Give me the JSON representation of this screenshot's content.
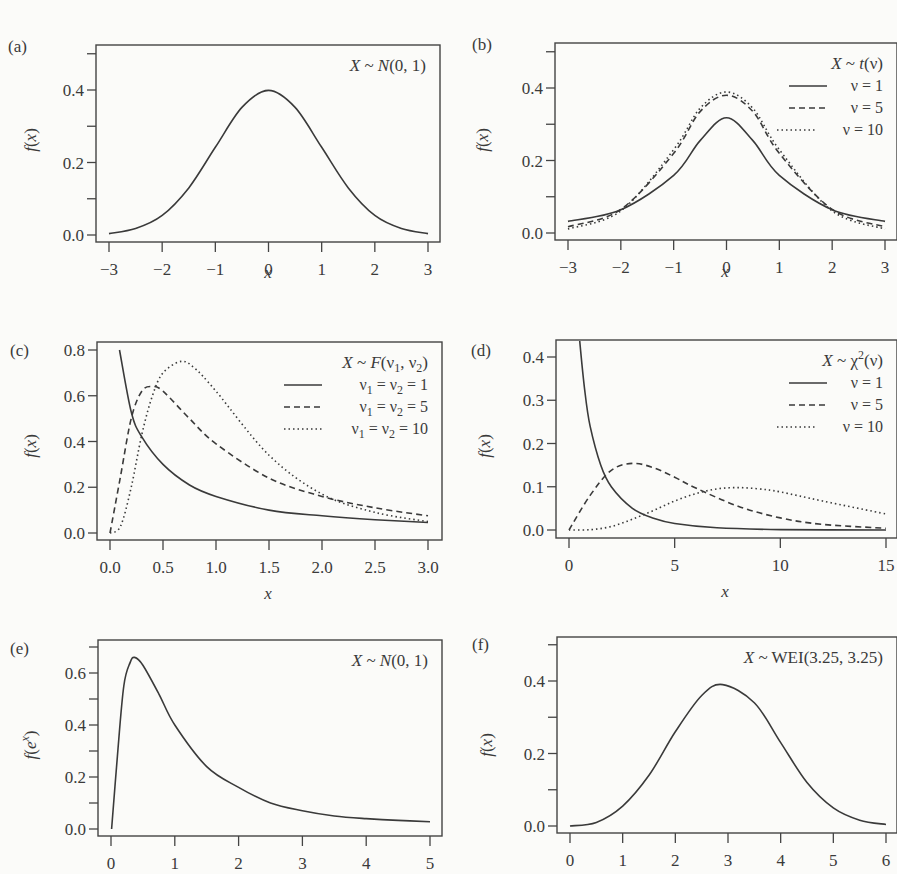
{
  "figure": {
    "panels": [
      {
        "id": "a",
        "label": "(a)",
        "title": "X ~ N(0, 1)",
        "ylabel": "f(x)",
        "xlabel": "x"
      },
      {
        "id": "b",
        "label": "(b)",
        "title": "X ~ t(ν)",
        "ylabel": "f(x)",
        "xlabel": "x",
        "legend": [
          "ν = 1",
          "ν = 5",
          "ν = 10"
        ]
      },
      {
        "id": "c",
        "label": "(c)",
        "title": "X ~ F(ν1, ν2)",
        "ylabel": "f(x)",
        "xlabel": "x",
        "legend": [
          "ν1 = ν2 = 1",
          "ν1 = ν2 = 5",
          "ν1 = ν2 = 10"
        ]
      },
      {
        "id": "d",
        "label": "(d)",
        "title": "X ~ χ2(ν)",
        "ylabel": "f(x)",
        "xlabel": "x",
        "legend": [
          "ν = 1",
          "ν = 5",
          "ν = 10"
        ]
      },
      {
        "id": "e",
        "label": "(e)",
        "title": "X ~ N(0, 1)",
        "ylabel": "f(e^x)",
        "xlabel": ""
      },
      {
        "id": "f",
        "label": "(f)",
        "title": "X ~ WEI(3.25, 3.25)",
        "ylabel": "f(x)",
        "xlabel": ""
      }
    ]
  },
  "chart_data": [
    {
      "panel": "a",
      "type": "line",
      "title": "X ~ N(0, 1)",
      "xlabel": "x",
      "ylabel": "f(x)",
      "xlim": [
        -3,
        3
      ],
      "ylim": [
        0,
        0.5
      ],
      "xticks": [
        "-3",
        "-2",
        "-1",
        "0",
        "1",
        "2",
        "3"
      ],
      "yticks": [
        "0.0",
        "0.2",
        "0.4"
      ],
      "series": [
        {
          "name": "N(0,1)",
          "style": "solid",
          "x": [
            -3,
            -2.5,
            -2,
            -1.5,
            -1,
            -0.5,
            0,
            0.5,
            1,
            1.5,
            2,
            2.5,
            3
          ],
          "y": [
            0.004,
            0.018,
            0.054,
            0.13,
            0.242,
            0.352,
            0.399,
            0.352,
            0.242,
            0.13,
            0.054,
            0.018,
            0.004
          ]
        }
      ],
      "grid": false
    },
    {
      "panel": "b",
      "type": "line",
      "title": "X ~ t(ν)",
      "xlabel": "x",
      "ylabel": "f(x)",
      "xlim": [
        -3,
        3
      ],
      "ylim": [
        0,
        0.5
      ],
      "xticks": [
        "-3",
        "-2",
        "-1",
        "0",
        "1",
        "2",
        "3"
      ],
      "yticks": [
        "0.0",
        "0.2",
        "0.4"
      ],
      "legend_position": "top-right",
      "series": [
        {
          "name": "ν = 1",
          "style": "solid",
          "x": [
            -3,
            -2,
            -1,
            -0.5,
            0,
            0.5,
            1,
            2,
            3
          ],
          "y": [
            0.032,
            0.064,
            0.159,
            0.255,
            0.318,
            0.255,
            0.159,
            0.064,
            0.032
          ]
        },
        {
          "name": "ν = 5",
          "style": "dashed",
          "x": [
            -3,
            -2,
            -1,
            -0.5,
            0,
            0.5,
            1,
            2,
            3
          ],
          "y": [
            0.017,
            0.065,
            0.22,
            0.335,
            0.38,
            0.335,
            0.22,
            0.065,
            0.017
          ]
        },
        {
          "name": "ν = 10",
          "style": "dotted",
          "x": [
            -3,
            -2,
            -1,
            -0.5,
            0,
            0.5,
            1,
            2,
            3
          ],
          "y": [
            0.011,
            0.061,
            0.23,
            0.344,
            0.389,
            0.344,
            0.23,
            0.061,
            0.011
          ]
        }
      ],
      "grid": false
    },
    {
      "panel": "c",
      "type": "line",
      "title": "X ~ F(ν1, ν2)",
      "xlabel": "x",
      "ylabel": "f(x)",
      "xlim": [
        0,
        3
      ],
      "ylim": [
        0,
        0.8
      ],
      "xticks": [
        "0.0",
        "0.5",
        "1.0",
        "1.5",
        "2.0",
        "2.5",
        "3.0"
      ],
      "yticks": [
        "0.0",
        "0.2",
        "0.4",
        "0.6",
        "0.8"
      ],
      "legend_position": "top-right",
      "series": [
        {
          "name": "ν1 = ν2 = 1",
          "style": "solid",
          "x": [
            0.09,
            0.2,
            0.3,
            0.5,
            0.75,
            1.0,
            1.5,
            2.0,
            2.5,
            3.0
          ],
          "y": [
            0.8,
            0.53,
            0.42,
            0.3,
            0.21,
            0.16,
            0.1,
            0.075,
            0.058,
            0.046
          ]
        },
        {
          "name": "ν1 = ν2 = 5",
          "style": "dashed",
          "x": [
            0,
            0.1,
            0.2,
            0.3,
            0.4,
            0.5,
            0.75,
            1.0,
            1.5,
            2.0,
            2.5,
            3.0
          ],
          "y": [
            0,
            0.25,
            0.5,
            0.62,
            0.64,
            0.62,
            0.5,
            0.39,
            0.24,
            0.16,
            0.11,
            0.075
          ]
        },
        {
          "name": "ν1 = ν2 = 10",
          "style": "dotted",
          "x": [
            0,
            0.1,
            0.2,
            0.3,
            0.4,
            0.5,
            0.67,
            0.8,
            1.0,
            1.5,
            2.0,
            2.5,
            3.0
          ],
          "y": [
            0,
            0.03,
            0.2,
            0.43,
            0.6,
            0.7,
            0.75,
            0.72,
            0.62,
            0.34,
            0.17,
            0.09,
            0.05
          ]
        }
      ],
      "grid": false
    },
    {
      "panel": "d",
      "type": "line",
      "title": "X ~ χ2(ν)",
      "xlabel": "x",
      "ylabel": "f(x)",
      "xlim": [
        0,
        15
      ],
      "ylim": [
        0,
        0.4
      ],
      "xticks": [
        "0",
        "5",
        "10",
        "15"
      ],
      "yticks": [
        "0.0",
        "0.1",
        "0.2",
        "0.3",
        "0.4"
      ],
      "legend_position": "top-right",
      "series": [
        {
          "name": "ν = 1",
          "style": "solid",
          "x": [
            0.5,
            0.75,
            1,
            1.5,
            2,
            3,
            4,
            5,
            7,
            10,
            15
          ],
          "y": [
            0.44,
            0.32,
            0.24,
            0.15,
            0.1,
            0.05,
            0.027,
            0.015,
            0.005,
            0.001,
            0.0
          ]
        },
        {
          "name": "ν = 5",
          "style": "dashed",
          "x": [
            0,
            1,
            2,
            3,
            4,
            5,
            6,
            8,
            10,
            12,
            15
          ],
          "y": [
            0,
            0.08,
            0.138,
            0.154,
            0.144,
            0.122,
            0.097,
            0.055,
            0.028,
            0.013,
            0.004
          ]
        },
        {
          "name": "ν = 10",
          "style": "dotted",
          "x": [
            0,
            1,
            2,
            3,
            4,
            5,
            6,
            7,
            8,
            9,
            10,
            12,
            15
          ],
          "y": [
            0,
            0.0008,
            0.008,
            0.025,
            0.045,
            0.067,
            0.084,
            0.095,
            0.098,
            0.095,
            0.088,
            0.067,
            0.037
          ]
        }
      ],
      "grid": false
    },
    {
      "panel": "e",
      "type": "line",
      "title": "X ~ N(0, 1)",
      "xlabel": "",
      "ylabel": "f(e^x)",
      "xlim": [
        0,
        5
      ],
      "ylim": [
        0,
        0.7
      ],
      "xticks": [
        "0",
        "1",
        "2",
        "3",
        "4",
        "5"
      ],
      "yticks": [
        "0.0",
        "0.2",
        "0.4",
        "0.6"
      ],
      "series": [
        {
          "name": "lognormal",
          "style": "solid",
          "x": [
            0.01,
            0.1,
            0.2,
            0.3,
            0.37,
            0.5,
            0.75,
            1.0,
            1.5,
            2,
            2.5,
            3,
            3.5,
            4,
            4.5,
            5
          ],
          "y": [
            0.0,
            0.28,
            0.55,
            0.64,
            0.66,
            0.63,
            0.52,
            0.4,
            0.24,
            0.16,
            0.1,
            0.07,
            0.05,
            0.04,
            0.033,
            0.028
          ]
        }
      ],
      "grid": false
    },
    {
      "panel": "f",
      "type": "line",
      "title": "X ~ WEI(3.25, 3.25)",
      "xlabel": "",
      "ylabel": "f(x)",
      "xlim": [
        0,
        6
      ],
      "ylim": [
        0,
        0.5
      ],
      "xticks": [
        "0",
        "1",
        "2",
        "3",
        "4",
        "5",
        "6"
      ],
      "yticks": [
        "0.0",
        "0.2",
        "0.4"
      ],
      "series": [
        {
          "name": "Weibull",
          "style": "solid",
          "x": [
            0,
            0.5,
            1,
            1.5,
            2,
            2.5,
            2.9,
            3.5,
            4,
            4.5,
            5,
            5.5,
            6
          ],
          "y": [
            0,
            0.01,
            0.055,
            0.14,
            0.26,
            0.36,
            0.39,
            0.34,
            0.23,
            0.12,
            0.05,
            0.016,
            0.004
          ]
        }
      ],
      "grid": false
    }
  ]
}
